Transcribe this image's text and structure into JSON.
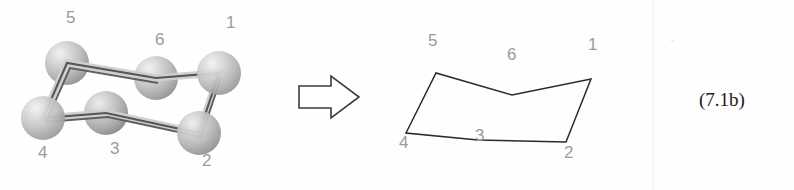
{
  "figure": {
    "equation_number": "(7.1b)",
    "arrow_icon": "right-block-arrow-icon",
    "divider_color": "#f7f7f8",
    "background_color": "#fefefe"
  },
  "ball_and_stick_model": {
    "label_color": "#9b9b9b",
    "bond_color": "#575757",
    "sphere_color_light": "#e8e8e8",
    "sphere_color_mid": "#b9b9b9",
    "sphere_color_dark": "#8f8f8f",
    "atoms": [
      {
        "id": "atom-1",
        "number": "1",
        "cx": 219,
        "cy": 73,
        "r": 22,
        "label_x": 226,
        "label_y": 22
      },
      {
        "id": "atom-2",
        "number": "2",
        "cx": 199,
        "cy": 133,
        "r": 22,
        "label_x": 202,
        "label_y": 160
      },
      {
        "id": "atom-3",
        "number": "3",
        "cx": 106,
        "cy": 113,
        "r": 22,
        "label_x": 110,
        "label_y": 148
      },
      {
        "id": "atom-4",
        "number": "4",
        "cx": 43,
        "cy": 118,
        "r": 22,
        "label_x": 38,
        "label_y": 152
      },
      {
        "id": "atom-5",
        "number": "5",
        "cx": 67,
        "cy": 63,
        "r": 22,
        "label_x": 66,
        "label_y": 15
      },
      {
        "id": "atom-6",
        "number": "6",
        "cx": 156,
        "cy": 78,
        "r": 22,
        "label_x": 155,
        "label_y": 38
      }
    ],
    "bond_path": "M 219 73 L 199 133 L 106 113 L 43 118 L 67 63 L 156 78 Z",
    "bond_vertices": [
      {
        "name": "v1",
        "x": 219,
        "y": 73
      },
      {
        "name": "v2",
        "x": 199,
        "y": 133
      },
      {
        "name": "v3",
        "x": 106,
        "y": 113
      },
      {
        "name": "v4",
        "x": 43,
        "y": 118
      },
      {
        "name": "v5",
        "x": 67,
        "y": 63
      },
      {
        "name": "v6",
        "x": 156,
        "y": 78
      }
    ]
  },
  "skeletal_drawing": {
    "label_color": "#9b9b9b",
    "line_color": "#2a2a2a",
    "vertices": [
      {
        "id": "vertex-1",
        "number": "1",
        "x": 591,
        "y": 79,
        "label_x": 588,
        "label_y": 44
      },
      {
        "id": "vertex-2",
        "number": "2",
        "x": 566,
        "y": 142,
        "label_x": 564,
        "label_y": 152
      },
      {
        "id": "vertex-3",
        "number": "3",
        "x": 478,
        "y": 140,
        "label_x": 475,
        "label_y": 135
      },
      {
        "id": "vertex-4",
        "number": "4",
        "x": 406,
        "y": 133,
        "label_x": 399,
        "label_y": 142
      },
      {
        "id": "vertex-5",
        "number": "5",
        "x": 436,
        "y": 73,
        "label_x": 428,
        "label_y": 40
      },
      {
        "id": "vertex-6",
        "number": "6",
        "x": 512,
        "y": 95,
        "label_x": 507,
        "label_y": 54
      }
    ],
    "ring_path": "M 591 79 L 566 142 L 478 140 L 406 133 L 436 73 L 512 95 Z"
  },
  "arrow": {
    "name": "right-block-arrow-icon",
    "outline_color": "#3b3b3b",
    "fill_color": "#ffffff",
    "path": "M 299 86 L 331 86 L 331 76 L 359 97 L 331 118 L 331 108 L 299 108 Z"
  }
}
